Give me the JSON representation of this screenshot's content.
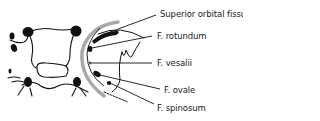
{
  "diagram": {
    "colors": {
      "outline": "#111111",
      "arc": "#a8a8a8",
      "text": "#1a1a1a"
    },
    "labels": [
      {
        "id": "superior-orbital-fissure",
        "text": "Superior orbital fissure"
      },
      {
        "id": "f-rotundum",
        "text": "F. rotundum"
      },
      {
        "id": "f-vesalii",
        "text": "F. vesalii"
      },
      {
        "id": "f-ovale",
        "text": "F. ovale"
      },
      {
        "id": "f-spinosum",
        "text": "F. spinosum"
      }
    ]
  }
}
